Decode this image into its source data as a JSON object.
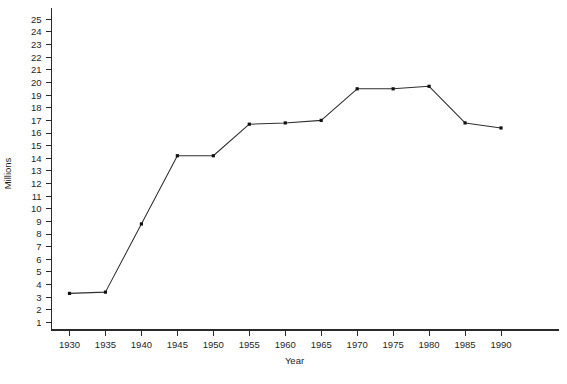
{
  "chart_data": {
    "type": "line",
    "title": "",
    "xlabel": "Year",
    "ylabel": "Millions",
    "grid": false,
    "legend": false,
    "x": [
      1930,
      1935,
      1940,
      1945,
      1950,
      1955,
      1960,
      1965,
      1970,
      1975,
      1980,
      1985,
      1990
    ],
    "values": [
      3.3,
      3.4,
      8.8,
      14.2,
      14.2,
      16.7,
      16.8,
      17.0,
      19.5,
      19.5,
      19.7,
      16.8,
      16.4
    ],
    "series": [
      {
        "name": "",
        "values": [
          3.3,
          3.4,
          8.8,
          14.2,
          14.2,
          16.7,
          16.8,
          17.0,
          19.5,
          19.5,
          19.7,
          16.8,
          16.4
        ]
      }
    ],
    "xtick_labels": [
      "1930",
      "1935",
      "1940",
      "1945",
      "1950",
      "1955",
      "1960",
      "1965",
      "1970",
      "1975",
      "1980",
      "1985",
      "1990"
    ],
    "ytick_labels": [
      "1",
      "2",
      "3",
      "4",
      "5",
      "6",
      "7",
      "8",
      "9",
      "10",
      "11",
      "12",
      "13",
      "14",
      "15",
      "16",
      "17",
      "18",
      "19",
      "20",
      "21",
      "22",
      "23",
      "24",
      "25"
    ],
    "yticks": [
      1,
      2,
      3,
      4,
      5,
      6,
      7,
      8,
      9,
      10,
      11,
      12,
      13,
      14,
      15,
      16,
      17,
      18,
      19,
      20,
      21,
      22,
      23,
      24,
      25
    ],
    "xlim": [
      1927.5,
      1992.5
    ],
    "ylim": [
      0.4,
      25.9
    ],
    "line_color": "#2f2f2f",
    "marker_color": "#111111",
    "axis_color": "#2a2a2a",
    "background": "#ffffff"
  },
  "scan_artifacts": {
    "top_fragment": "",
    "bottom_fragment": ""
  }
}
